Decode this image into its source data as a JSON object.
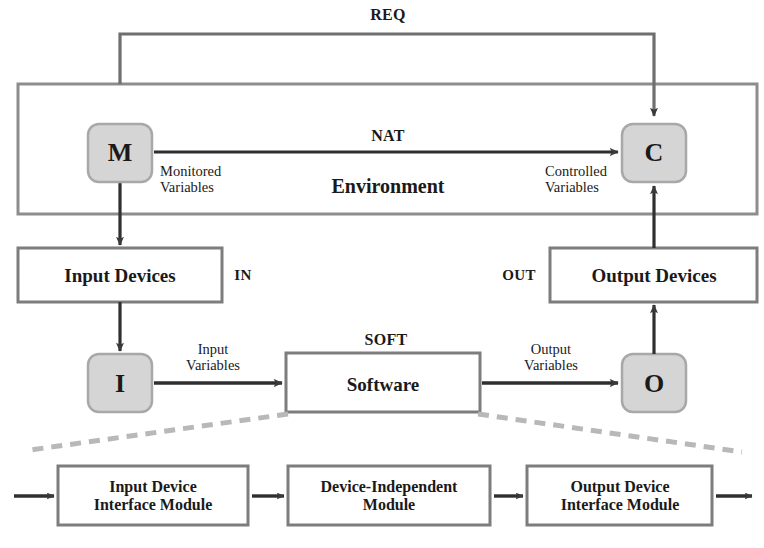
{
  "diagram": {
    "colors": {
      "stroke": "#6b6b6b",
      "arrow": "#3a3a3a",
      "node_fill": "#d5d5d5",
      "node_stroke": "#a8a8a8",
      "dashed": "#b8b8b8",
      "text": "#1a1a1a",
      "background": "#ffffff"
    },
    "relations": {
      "req": "REQ",
      "nat": "NAT",
      "in": "IN",
      "out": "OUT",
      "soft": "SOFT"
    },
    "nodes": {
      "monitored": "M",
      "controlled": "C",
      "input": "I",
      "output": "O"
    },
    "boxes": {
      "environment": "Environment",
      "input_devices": "Input Devices",
      "output_devices": "Output Devices",
      "software": "Software"
    },
    "variable_labels": {
      "monitored_line1": "Monitored",
      "monitored_line2": "Variables",
      "controlled_line1": "Controlled",
      "controlled_line2": "Variables",
      "input_line1": "Input",
      "input_line2": "Variables",
      "output_line1": "Output",
      "output_line2": "Variables"
    },
    "modules": [
      {
        "line1": "Input Device",
        "line2": "Interface Module"
      },
      {
        "line1": "Device-Independent",
        "line2": "Module"
      },
      {
        "line1": "Output Device",
        "line2": "Interface Module"
      }
    ]
  }
}
